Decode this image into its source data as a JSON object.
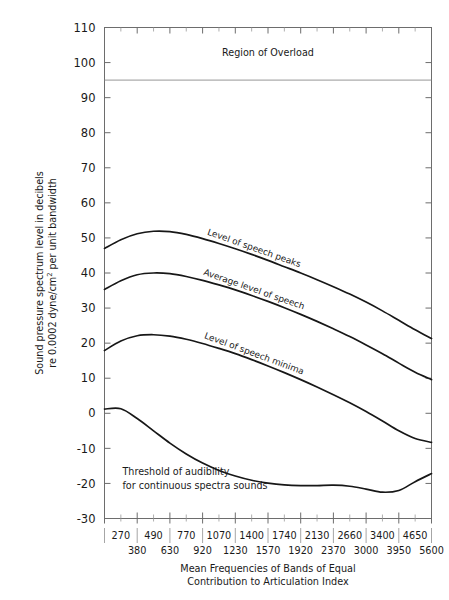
{
  "header": {
    "faint_cut_text": " "
  },
  "chart_data": {
    "type": "line",
    "title": "",
    "xlabel": "Mean Frequencies of Bands of Equal Contribution to Articulation Index",
    "xlabel_line1": "Mean Frequencies of Bands of Equal",
    "xlabel_line2": "Contribution to Articulation Index",
    "ylabel": "Sound pressure spectrum level in decibels re 0.0002 dyne/cm² per unit bandwidth",
    "ylabel_line1": "Sound pressure spectrum level in decibels",
    "ylabel_line2_pre": "re 0.0002 dyne/cm",
    "ylabel_line2_sup": "2",
    "ylabel_line2_post": " per unit bandwidth",
    "ylim": [
      -30,
      110
    ],
    "yticks": [
      -30,
      -20,
      -10,
      0,
      10,
      20,
      30,
      40,
      50,
      60,
      70,
      80,
      90,
      100,
      110
    ],
    "ytick_labels": [
      "-30",
      "-20",
      "-10",
      "0",
      "10",
      "20",
      "30",
      "40",
      "50",
      "60",
      "70",
      "80",
      "90",
      "100",
      "110"
    ],
    "grid": false,
    "legend_position": "inline-curve-labels",
    "x_axis_kind": "banded-frequency-index",
    "x_band_count": 20,
    "xtick_labels_upper": [
      "270",
      "490",
      "770",
      "1070",
      "1400",
      "1740",
      "2130",
      "2660",
      "3400",
      "4650"
    ],
    "xtick_labels_lower": [
      "380",
      "630",
      "920",
      "1230",
      "1570",
      "1920",
      "2370",
      "3000",
      "3950",
      "5600"
    ],
    "annotations": [
      {
        "text": "Region of Overload",
        "x_frac": 0.5,
        "y_value": 102,
        "style": "center"
      },
      {
        "text": "Threshold of audibility",
        "x_frac": 0.055,
        "y_value": -17.5,
        "style": "left"
      },
      {
        "text": "for continuous spectra sounds",
        "x_frac": 0.055,
        "y_value": -21.5,
        "style": "left"
      }
    ],
    "reference_lines": [
      {
        "label": "overload threshold",
        "y_value": 95,
        "orientation": "horizontal"
      }
    ],
    "series": [
      {
        "name": "Level of speech peaks",
        "label_text": "Level of speech peaks",
        "x": [
          0,
          1,
          2,
          3,
          4,
          5,
          6,
          7,
          8,
          9,
          10,
          11,
          12,
          13,
          14,
          15,
          16,
          17,
          18,
          19,
          20
        ],
        "values": [
          47.0,
          49.5,
          51.2,
          51.9,
          51.8,
          51.0,
          49.8,
          48.4,
          46.9,
          45.3,
          43.6,
          41.8,
          40.0,
          38.1,
          36.1,
          34.0,
          31.7,
          29.2,
          26.5,
          23.8,
          21.3
        ]
      },
      {
        "name": "Average level of speech",
        "label_text": "Average level of speech",
        "x": [
          0,
          1,
          2,
          3,
          4,
          5,
          6,
          7,
          8,
          9,
          10,
          11,
          12,
          13,
          14,
          15,
          16,
          17,
          18,
          19,
          20
        ],
        "values": [
          35.3,
          37.8,
          39.5,
          40.0,
          39.8,
          39.0,
          37.9,
          36.6,
          35.2,
          33.6,
          31.9,
          30.1,
          28.2,
          26.2,
          24.1,
          21.9,
          19.5,
          17.0,
          14.3,
          11.7,
          9.6
        ]
      },
      {
        "name": "Level of speech minima",
        "label_text": "Level of speech minima",
        "x": [
          0,
          1,
          2,
          3,
          4,
          5,
          6,
          7,
          8,
          9,
          10,
          11,
          12,
          13,
          14,
          15,
          16,
          17,
          18,
          19,
          20
        ],
        "values": [
          17.9,
          20.6,
          22.1,
          22.4,
          22.0,
          21.1,
          19.9,
          18.5,
          17.0,
          15.3,
          13.5,
          11.6,
          9.6,
          7.5,
          5.3,
          3.0,
          0.5,
          -2.2,
          -5.0,
          -7.2,
          -8.3
        ]
      },
      {
        "name": "Threshold of audibility for continuous spectra sounds",
        "label_text": "",
        "x": [
          0,
          1,
          2,
          3,
          4,
          5,
          6,
          7,
          8,
          9,
          10,
          11,
          12,
          13,
          14,
          15,
          16,
          17,
          18,
          19,
          20
        ],
        "values": [
          1.2,
          1.3,
          -1.5,
          -5.0,
          -8.5,
          -11.6,
          -14.2,
          -16.3,
          -17.9,
          -19.1,
          -19.9,
          -20.4,
          -20.6,
          -20.6,
          -20.5,
          -20.8,
          -21.6,
          -22.5,
          -22.0,
          -19.5,
          -17.2
        ]
      }
    ]
  }
}
